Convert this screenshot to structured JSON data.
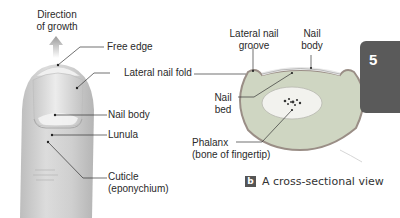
{
  "figure": {
    "part_a": {
      "arrow_label_line1": "Direction",
      "arrow_label_line2": "of growth",
      "labels": {
        "free_edge": "Free edge",
        "lateral_nail_fold": "Lateral nail fold",
        "nail_body": "Nail body",
        "lunula": "Lunula",
        "cuticle_line1": "Cuticle",
        "cuticle_line2": "(eponychium)"
      }
    },
    "part_b": {
      "labels": {
        "lateral_nail_groove_line1": "Lateral nail",
        "lateral_nail_groove_line2": "groove",
        "nail_body_line1": "Nail",
        "nail_body_line2": "body",
        "nail_bed_line1": "Nail",
        "nail_bed_line2": "bed",
        "phalanx_line1": "Phalanx",
        "phalanx_line2": "(bone of fingertip)"
      },
      "caption_badge": "b",
      "caption_text": "A cross-sectional view"
    },
    "chapter_tab": "5",
    "colors": {
      "tab": "#5a5a5a",
      "skin": "#d2d2d2",
      "nail": "#e2e2e2",
      "tissue": "#cfd6c2",
      "leader": "#333333"
    }
  }
}
